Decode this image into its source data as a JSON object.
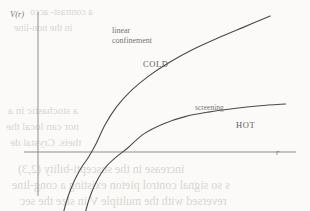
{
  "figure": {
    "kind": "physics-potential-plot",
    "background_color": "#fbfaf8",
    "ink_color": "#4a4a4a",
    "axis_color": "#8d8d8d"
  },
  "axes": {
    "y_label": "V(r)",
    "x_label": "r",
    "y_axis_x_px": 38,
    "x_axis_y_px": 152,
    "y_axis_top_px": 12,
    "y_axis_bottom_px": 196,
    "x_axis_left_px": 24,
    "x_axis_right_px": 296,
    "grid": false
  },
  "annotations": {
    "linear_confinement_line1": "linear",
    "linear_confinement_line2": "confinement",
    "screening": "screening",
    "cold": "COLD",
    "hot": "HOT"
  },
  "bleed_through": {
    "lines": [
      "a contrast- acco",
      "in the non-line",
      "a stochastic in a",
      "nor can local the",
      "theis. Crystal de",
      "increase in the suscepti-bility (2,3)",
      "s so signal control pieton existing a cong-line",
      "reversed with the multiple V in size the sec"
    ]
  },
  "chart_data": {
    "type": "line",
    "title": "",
    "xlabel": "r",
    "ylabel": "V(r)",
    "grid": false,
    "legend": "inline-annotations",
    "xlim": [
      0,
      10
    ],
    "ylim": [
      -3.2,
      3.0
    ],
    "series": [
      {
        "name": "COLD",
        "description": "confining potential: steep Coulomb-like rise at small r followed by linear confinement at large r",
        "annotation": "linear confinement",
        "x": [
          1.0,
          1.1,
          1.22,
          1.35,
          1.5,
          1.7,
          1.95,
          2.25,
          2.6,
          3.05,
          3.6,
          4.3,
          5.1,
          6.0,
          7.0,
          8.0,
          9.0
        ],
        "y": [
          -3.2,
          -2.7,
          -2.2,
          -1.75,
          -1.3,
          -0.8,
          -0.3,
          0.18,
          0.6,
          1.0,
          1.35,
          1.68,
          1.98,
          2.26,
          2.52,
          2.76,
          3.0
        ]
      },
      {
        "name": "HOT",
        "description": "screened potential: rises then saturates to a constant plateau at large r",
        "annotation": "screening",
        "x": [
          1.85,
          1.95,
          2.08,
          2.25,
          2.45,
          2.7,
          3.05,
          3.5,
          4.1,
          4.85,
          5.7,
          6.6,
          7.6,
          8.6,
          9.6
        ],
        "y": [
          -3.2,
          -2.7,
          -2.18,
          -1.65,
          -1.15,
          -0.7,
          -0.25,
          0.1,
          0.4,
          0.62,
          0.78,
          0.88,
          0.96,
          1.02,
          1.06
        ]
      }
    ],
    "region_labels": [
      {
        "text": "COLD",
        "x": 4.0,
        "y": 2.0
      },
      {
        "text": "HOT",
        "x": 8.2,
        "y": 0.55
      }
    ]
  }
}
